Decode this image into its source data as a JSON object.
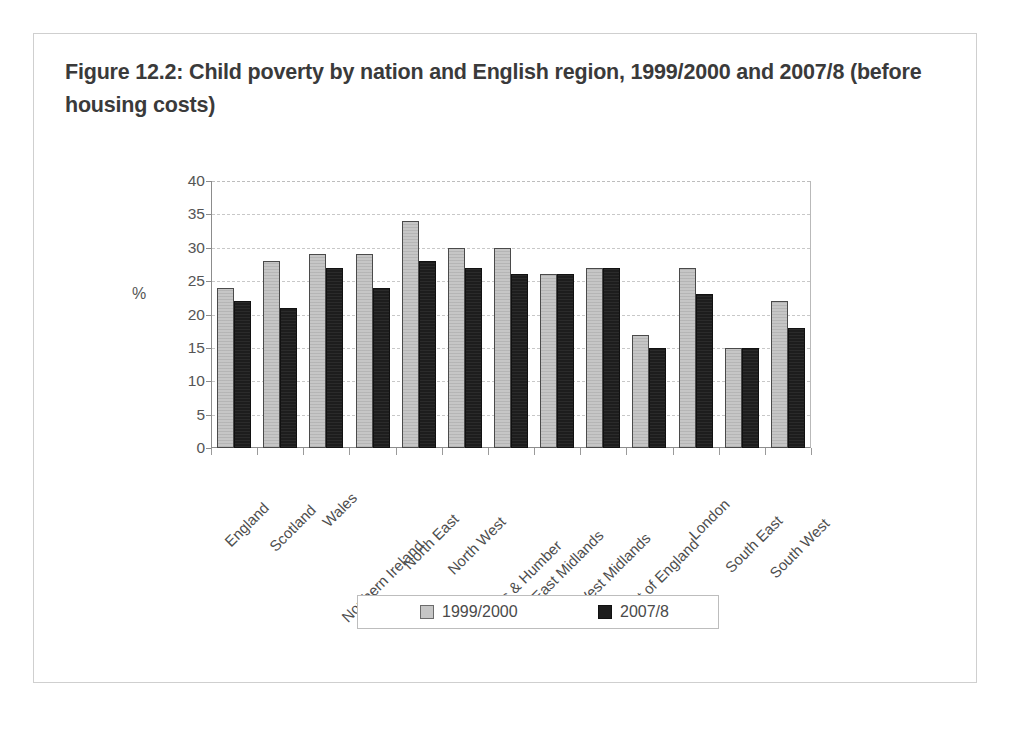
{
  "figure": {
    "title": "Figure 12.2: Child poverty by nation and English region, 1999/2000 and 2007/8 (before housing costs)"
  },
  "chart_data": {
    "type": "bar",
    "title": "Figure 12.2: Child poverty by nation and English region, 1999/2000 and 2007/8 (before housing costs)",
    "xlabel": "",
    "ylabel": "%",
    "ylim": [
      0,
      40
    ],
    "yticks": [
      0,
      5,
      10,
      15,
      20,
      25,
      30,
      35,
      40
    ],
    "grid": true,
    "legend_position": "bottom",
    "categories": [
      "England",
      "Scotland",
      "Wales",
      "Northern Ireland",
      "North East",
      "North West",
      "Yorks & Humber",
      "East Midlands",
      "West Midlands",
      "East of England",
      "London",
      "South East",
      "South West"
    ],
    "series": [
      {
        "name": "1999/2000",
        "color": "#c6c6c6",
        "values": [
          24,
          28,
          29,
          29,
          34,
          30,
          30,
          26,
          27,
          17,
          27,
          15,
          22
        ]
      },
      {
        "name": "2007/8",
        "color": "#1d1d1d",
        "values": [
          22,
          21,
          27,
          24,
          28,
          27,
          26,
          26,
          27,
          15,
          23,
          15,
          18
        ]
      }
    ]
  }
}
